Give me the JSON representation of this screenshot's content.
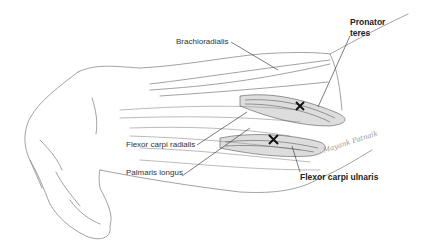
{
  "figure": {
    "labels": {
      "brachioradialis": "Brachioradialis",
      "pronator_teres_line1": "Pronator",
      "pronator_teres_line2": "teres",
      "flexor_carpi_radialis": "Flexor carpi radialis",
      "palmaris_longus": "Palmaris longus",
      "flexor_carpi_ulnaris": "Flexor carpi ulnaris"
    },
    "markers": [
      {
        "symbol": "×",
        "target": "Pronator teres"
      },
      {
        "symbol": "×",
        "target": "Flexor carpi ulnaris"
      }
    ],
    "signature": "Mayank Patnaik"
  }
}
